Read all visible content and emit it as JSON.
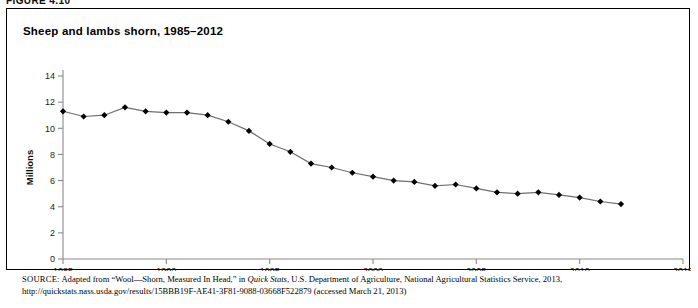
{
  "figure": {
    "header_label": "FIGURE 4.10",
    "title": "Sheep and lambs shorn, 1985–2012"
  },
  "source": {
    "label": "SOURCE:",
    "text_part1": " Adapted from “Wool—Shorn, Measured In Head,” in ",
    "italic_title": "Quick Stats",
    "text_part2": ", U.S. Department of Agriculture, National Agricultural Statistics Service, 2013,",
    "line2": "http://quickstats.nass.usda.gov/results/15BBB19F-AE41-3F81-9088-03668F522879 (accessed March 21, 2013)"
  },
  "chart_data": {
    "type": "line",
    "title": "Sheep and lambs shorn, 1985–2012",
    "xlabel": "",
    "ylabel": "Millions",
    "xlim": [
      1985,
      2015
    ],
    "ylim": [
      0,
      14
    ],
    "xticks": [
      1985,
      1990,
      1995,
      2000,
      2005,
      2010,
      2015
    ],
    "yticks": [
      0,
      2,
      4,
      6,
      8,
      10,
      12,
      14
    ],
    "grid": false,
    "legend": "none",
    "marker": "diamond",
    "line_color": "#6f6f6f",
    "marker_color": "#000000",
    "x": [
      1985,
      1986,
      1987,
      1988,
      1989,
      1990,
      1991,
      1992,
      1993,
      1994,
      1995,
      1996,
      1997,
      1998,
      1999,
      2000,
      2001,
      2002,
      2003,
      2004,
      2005,
      2006,
      2007,
      2008,
      2009,
      2010,
      2011,
      2012
    ],
    "values": [
      11.3,
      10.9,
      11.0,
      11.6,
      11.3,
      11.2,
      11.2,
      11.0,
      10.5,
      9.8,
      8.8,
      8.2,
      7.3,
      7.0,
      6.6,
      6.3,
      6.0,
      5.9,
      5.6,
      5.7,
      5.4,
      5.1,
      5.0,
      5.1,
      4.9,
      4.7,
      4.4,
      4.2
    ],
    "series_name": "Sheep and lambs shorn"
  }
}
